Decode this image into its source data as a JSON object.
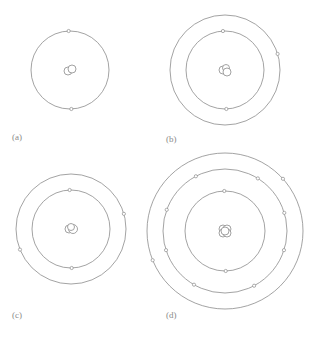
{
  "figure": {
    "stroke_color": "#8c8c8c",
    "panels": [
      {
        "label": "(a)",
        "label_pos": [
          12,
          132
        ],
        "center": [
          70,
          70
        ],
        "nucleus": [
          [
            -2,
            1,
            4
          ],
          [
            2,
            -1,
            4
          ]
        ],
        "shells": [
          {
            "r": 39,
            "electrons_deg": [
              -92,
              88
            ]
          }
        ]
      },
      {
        "label": "(b)",
        "label_pos": [
          166,
          134
        ],
        "center": [
          225,
          70
        ],
        "nucleus": [
          [
            -2,
            0,
            4
          ],
          [
            1,
            -2,
            3.5
          ],
          [
            2,
            2,
            4
          ]
        ],
        "shells": [
          {
            "r": 39,
            "electrons_deg": [
              -93,
              88
            ]
          },
          {
            "r": 55,
            "electrons_deg": [
              -17
            ]
          }
        ]
      },
      {
        "label": "(c)",
        "label_pos": [
          12,
          310
        ],
        "center": [
          71,
          229
        ],
        "nucleus": [
          [
            -2,
            0,
            4
          ],
          [
            2,
            0,
            4.5
          ],
          [
            0,
            -2,
            3.5
          ]
        ],
        "shells": [
          {
            "r": 39,
            "electrons_deg": [
              -92,
              89
            ]
          },
          {
            "r": 55,
            "electrons_deg": [
              -16,
              158
            ]
          }
        ]
      },
      {
        "label": "(d)",
        "label_pos": [
          166,
          310
        ],
        "center": [
          225,
          231
        ],
        "nucleus": [
          [
            -2,
            -2,
            4
          ],
          [
            2,
            -2,
            4
          ],
          [
            -2,
            2,
            4
          ],
          [
            2,
            2,
            4
          ],
          [
            0,
            0,
            4
          ]
        ],
        "shells": [
          {
            "r": 40,
            "electrons_deg": [
              -91,
              89
            ]
          },
          {
            "r": 62,
            "electrons_deg": [
              -118,
              -58,
              -17,
              18,
              62,
              120,
              162,
              200
            ]
          },
          {
            "r": 78,
            "electrons_deg": [
              -42,
              158
            ]
          }
        ]
      }
    ]
  }
}
